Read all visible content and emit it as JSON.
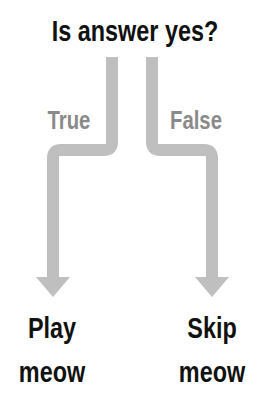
{
  "diagram": {
    "question": "Is answer yes?",
    "branches": [
      {
        "label": "True",
        "outcome_line1": "Play",
        "outcome_line2": "meow"
      },
      {
        "label": "False",
        "outcome_line1": "Skip",
        "outcome_line2": "meow"
      }
    ],
    "colors": {
      "text": "#111111",
      "branch_label": "#8a8a8a",
      "arrow": "#bfbfbf",
      "background": "#ffffff"
    }
  }
}
